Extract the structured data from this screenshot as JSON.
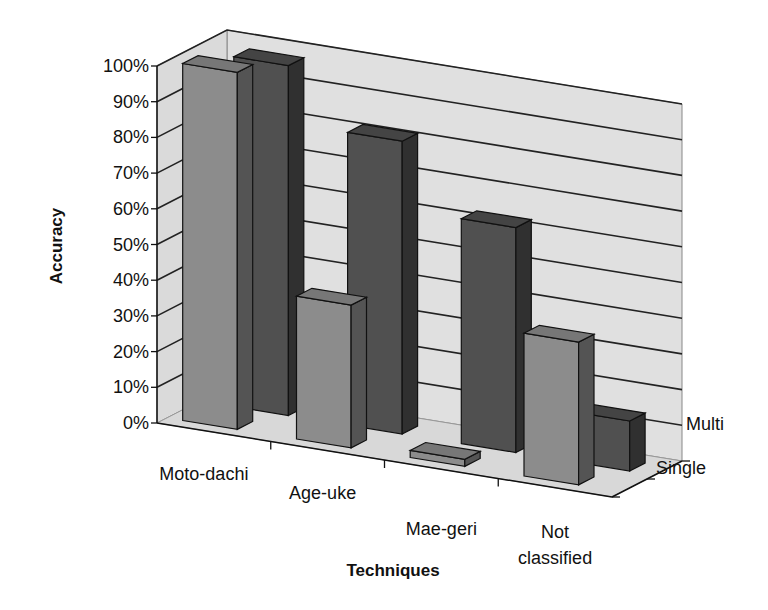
{
  "chart_data": {
    "type": "bar",
    "subtype": "3d-clustered-depth",
    "title": "",
    "xlabel": "Techniques",
    "ylabel": "Accuracy",
    "zlabel": "",
    "categories": [
      "Moto-dachi",
      "Age-uke",
      "Mae-geri",
      "Not classified"
    ],
    "category_display": [
      [
        "Moto-dachi"
      ],
      [
        "Age-uke"
      ],
      [
        "Mae-geri"
      ],
      [
        "Not",
        "classified"
      ]
    ],
    "series": [
      {
        "name": "Single",
        "values": [
          100,
          40,
          2,
          40
        ],
        "color": "#8c8c8c"
      },
      {
        "name": "Multi",
        "values": [
          98,
          82,
          63,
          14
        ],
        "color": "#505050"
      }
    ],
    "y_ticks": [
      "0%",
      "10%",
      "20%",
      "30%",
      "40%",
      "50%",
      "60%",
      "70%",
      "80%",
      "90%",
      "100%"
    ],
    "ylim": [
      0,
      100
    ],
    "y_unit": "%",
    "grid": true,
    "legend": "depth-axis labels (Multi, Single)",
    "wall_color": "#e0e0e0",
    "floor_color": "#d8d8d8"
  }
}
